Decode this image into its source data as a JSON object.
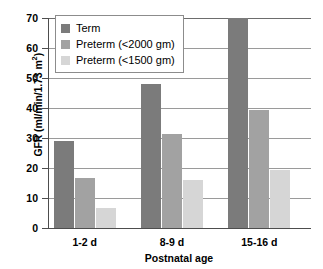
{
  "chart_data": {
    "type": "bar",
    "title": "",
    "categories": [
      "1-2 d",
      "8-9 d",
      "15-16 d"
    ],
    "series": [
      {
        "name": "Term",
        "color": "#7b7b7b",
        "values": [
          29,
          48,
          70
        ]
      },
      {
        "name": "Preterm (<2000 gm)",
        "color": "#a2a2a2",
        "values": [
          16.7,
          31.5,
          39.5
        ]
      },
      {
        "name": "Preterm (<1500 gm)",
        "color": "#d6d6d6",
        "values": [
          6.7,
          16,
          19.5
        ]
      }
    ],
    "xlabel": "Postnatal age",
    "ylabel": "GFR (ml/min/1.73 m²)",
    "ylim": [
      0,
      70
    ],
    "ytick_values": [
      0,
      10,
      20,
      30,
      40,
      50,
      60,
      70
    ],
    "ytick_labels": [
      "0",
      "10",
      "20",
      "30",
      "40",
      "50",
      "60",
      "70"
    ],
    "grid": true,
    "legend_position": "top-left"
  },
  "axis": {
    "y_title_main": "GFR (ml/min/1.73 m",
    "y_title_sup": "2",
    "y_title_close": ")",
    "x_title": "Postnatal age"
  },
  "legend": {
    "items": [
      {
        "label": "Term"
      },
      {
        "label": "Preterm (<2000 gm)"
      },
      {
        "label": "Preterm (<1500 gm)"
      }
    ]
  }
}
